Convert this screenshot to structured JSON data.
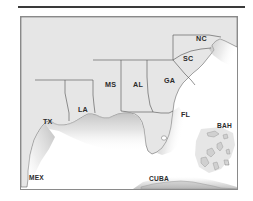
{
  "page": {
    "background_color": "#ffffff",
    "divider": {
      "name": "top-horizontal-rule",
      "color": "#3a3a3a"
    }
  },
  "map": {
    "title": "",
    "frame_color": "#8a8a8a",
    "land_color": "#e6e6e6",
    "water_color": "#ffffff",
    "shelf_color": "#b8b8b8",
    "border_color": "#555555",
    "labels": [
      {
        "id": "tx",
        "text": "TX",
        "x": 22,
        "y": 107
      },
      {
        "id": "la",
        "text": "LA",
        "x": 57,
        "y": 95
      },
      {
        "id": "ms",
        "text": "MS",
        "x": 84,
        "y": 70
      },
      {
        "id": "al",
        "text": "AL",
        "x": 112,
        "y": 70
      },
      {
        "id": "ga",
        "text": "GA",
        "x": 143,
        "y": 66
      },
      {
        "id": "sc",
        "text": "SC",
        "x": 162,
        "y": 44
      },
      {
        "id": "nc",
        "text": "NC",
        "x": 175,
        "y": 24
      },
      {
        "id": "fl",
        "text": "FL",
        "x": 160,
        "y": 100
      },
      {
        "id": "bah",
        "text": "BAH",
        "x": 196,
        "y": 111
      },
      {
        "id": "mex",
        "text": "MEX",
        "x": 8,
        "y": 163
      },
      {
        "id": "cuba",
        "text": "CUBA",
        "x": 128,
        "y": 164
      }
    ]
  }
}
